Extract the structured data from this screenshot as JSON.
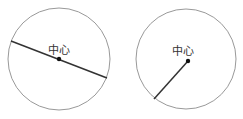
{
  "diagrams": [
    {
      "name": "circle-with-diameter",
      "center": {
        "x": 59,
        "y": 59
      },
      "radius": 51,
      "label": "中心",
      "segment": {
        "x1": 11,
        "y1": 41,
        "x2": 107,
        "y2": 78
      },
      "segment_type": "diameter"
    },
    {
      "name": "circle-with-radius",
      "center": {
        "x": 188,
        "y": 61
      },
      "radius": 50,
      "label": "中心",
      "segment": {
        "x1": 188,
        "y1": 61,
        "x2": 154,
        "y2": 99
      },
      "segment_type": "radius"
    }
  ],
  "colors": {
    "circle_stroke": "#999999",
    "segment_stroke": "#333333",
    "center_dot": "#111111",
    "label": "#333333"
  }
}
